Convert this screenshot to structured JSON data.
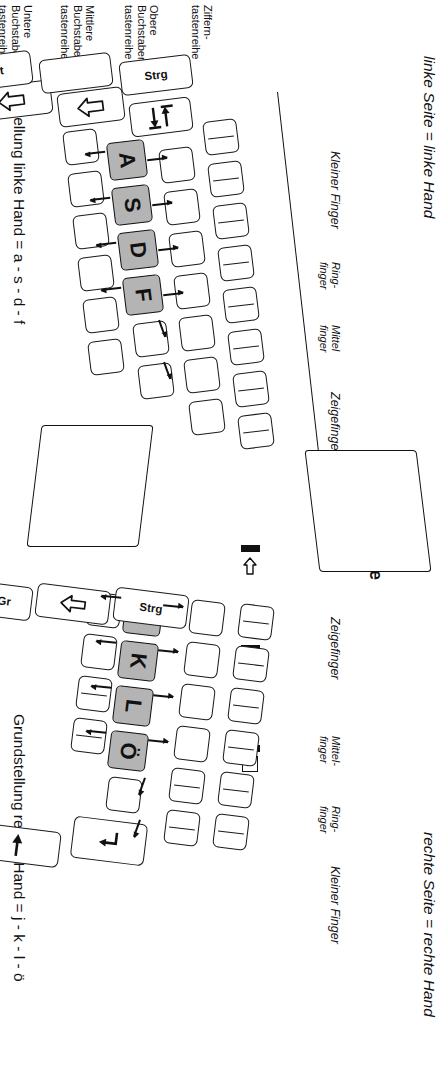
{
  "diagram": {
    "title_left": "linke Seite = linke Hand",
    "title_right": "rechte Seite = rechte Hand",
    "home_left": "Grundstellung linke Hand = a - s - d - f",
    "home_right": "Grundstellung rechte Hand = j - k - l - ö",
    "spacebar": "Leertaste"
  },
  "rows": {
    "r1": "Ziffern-\ntastenreihe",
    "r2": "Obere\nBuchstaben-\ntastenreihe",
    "r3": "Mittlere\nBuchstaben-\ntastenreihe",
    "r4": "Untere\nBuchstaben-\ntastenreihe"
  },
  "fingers_left": {
    "f1": "Kleiner Finger",
    "f2": "Ring-\nfinger",
    "f3": "Mittel\nfinger",
    "f4": "Zeigefinger"
  },
  "fingers_right": {
    "f1": "Zeigefinger",
    "f2": "Mittel-\nfinger",
    "f3": "Ring-\nfinger",
    "f4": "Kleiner Finger"
  },
  "home_keys_left": [
    "A",
    "S",
    "D",
    "F"
  ],
  "home_keys_right": [
    "J",
    "K",
    "L",
    "Ö"
  ],
  "modifiers": {
    "strg_left": "Strg",
    "alt": "Alt",
    "strg_right": "Strg",
    "alt_gr": "Alt Gr"
  },
  "indicators": [
    {
      "icon": "backspace-arrow",
      "glyph": ""
    },
    {
      "icon": "caps-lock-led",
      "glyph": "A"
    },
    {
      "icon": "num-lock-led",
      "glyph": "1"
    }
  ],
  "special_keys": {
    "tab": "tab-arrows-icon",
    "caps": "caps-arrow-icon",
    "shift_left": "shift-arrow-icon",
    "shift_right": "shift-up-arrow-icon",
    "enter": "enter-return-icon",
    "win": "win-arrow-icon"
  },
  "colors": {
    "home_key_fill": "#b4b4b4",
    "outline": "#1a1a1a",
    "background": "#ffffff"
  }
}
